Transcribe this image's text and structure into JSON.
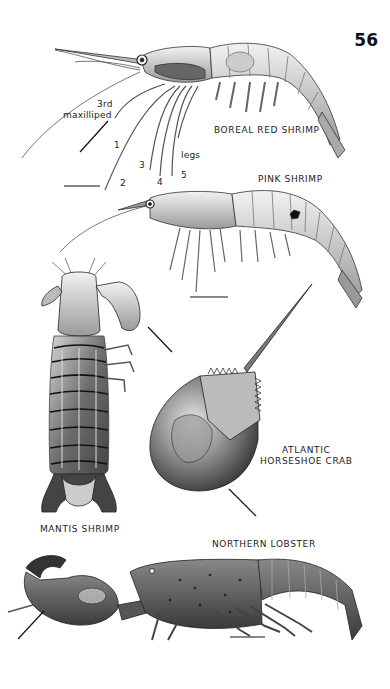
{
  "page": {
    "page_number": "56"
  },
  "plates": [
    {
      "name": "BOREAL RED SHRIMP",
      "annotations": {
        "maxilliped_label_line1": "3rd",
        "maxilliped_label_line2": "maxilliped",
        "leg_numbers": [
          "1",
          "2",
          "3",
          "4",
          "5"
        ],
        "legs_label": "legs"
      }
    },
    {
      "name": "PINK SHRIMP"
    },
    {
      "name": "MANTIS SHRIMP"
    },
    {
      "name_line1": "ATLANTIC",
      "name_line2": "HORSESHOE CRAB"
    },
    {
      "name": "NORTHERN LOBSTER"
    }
  ],
  "colors": {
    "ink": "#1a1a1a",
    "shade_dark": "#3a3a3a",
    "shade_mid": "#8a8a8a",
    "shade_light": "#d8d8d8",
    "paper": "#ffffff"
  }
}
